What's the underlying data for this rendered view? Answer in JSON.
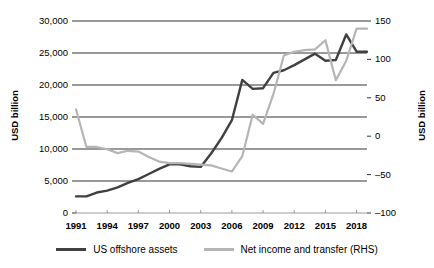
{
  "chart_data": {
    "type": "line",
    "title": "",
    "xlabel": "",
    "ylabel": "USD billion",
    "ylabel_right": "USD billion",
    "grid": true,
    "legend_position": "bottom",
    "xlim": [
      1991,
      2019
    ],
    "x_tick_labels": [
      "1991",
      "1994",
      "1997",
      "2000",
      "2003",
      "2006",
      "2009",
      "2012",
      "2015",
      "2018"
    ],
    "x_tick_values": [
      1991,
      1994,
      1997,
      2000,
      2003,
      2006,
      2009,
      2012,
      2015,
      2018
    ],
    "ylim": [
      0,
      30000
    ],
    "y_tick_labels": [
      "0",
      "5,000",
      "10,000",
      "15,000",
      "20,000",
      "25,000",
      "30,000"
    ],
    "y_tick_values": [
      0,
      5000,
      10000,
      15000,
      20000,
      25000,
      30000
    ],
    "ylim_right": [
      -100,
      150
    ],
    "y_tick_labels_right": [
      "-100",
      "-50",
      "0",
      "50",
      "100",
      "150"
    ],
    "y_tick_values_right": [
      -100,
      -50,
      0,
      50,
      100,
      150
    ],
    "x": [
      1991,
      1992,
      1993,
      1994,
      1995,
      1996,
      1997,
      1998,
      1999,
      2000,
      2001,
      2002,
      2003,
      2004,
      2005,
      2006,
      2007,
      2008,
      2009,
      2010,
      2011,
      2012,
      2013,
      2014,
      2015,
      2016,
      2017,
      2018,
      2019
    ],
    "series": [
      {
        "name": "US offshore assets",
        "axis": "left",
        "color": "#404040",
        "values": [
          2600,
          2600,
          3200,
          3500,
          4000,
          4700,
          5300,
          6100,
          6900,
          7600,
          7600,
          7300,
          7200,
          9300,
          11700,
          14500,
          20800,
          19400,
          19500,
          21900,
          22300,
          23100,
          24000,
          24900,
          23800,
          23900,
          27900,
          25200,
          25200
        ]
      },
      {
        "name": "Net income and transfer (RHS)",
        "axis": "right",
        "color": "#b5b5b5",
        "values": [
          35,
          -14,
          -14,
          -17,
          -22,
          -19,
          -20,
          -27,
          -33,
          -35,
          -35,
          -36,
          -37,
          -38,
          -42,
          -46,
          -26,
          28,
          16,
          55,
          105,
          110,
          112,
          113,
          125,
          73,
          98,
          140,
          140
        ]
      }
    ]
  },
  "legend": {
    "items": [
      {
        "label": "US offshore assets",
        "color": "#404040"
      },
      {
        "label": "Net income and transfer (RHS)",
        "color": "#b5b5b5"
      }
    ]
  }
}
